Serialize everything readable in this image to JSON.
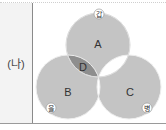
{
  "row_label": "(나)",
  "venn": {
    "circles": [
      {
        "id": "gap",
        "marker": "갑",
        "region_label": "A"
      },
      {
        "id": "eul",
        "marker": "을",
        "region_label": "B"
      },
      {
        "id": "byeong",
        "marker": "병",
        "region_label": "C"
      }
    ],
    "intersection_label": "D",
    "colors": {
      "fill": "#c4c4c4",
      "intersection_d": "#8e8e8e",
      "blank": "#ffffff",
      "outline": "#f2f2f2"
    }
  }
}
